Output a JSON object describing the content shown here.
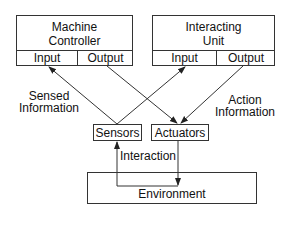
{
  "diagram": {
    "nodes": {
      "machine_controller": {
        "title_line1": "Machine",
        "title_line2": "Controller",
        "port_in": "Input",
        "port_out": "Output"
      },
      "interacting_unit": {
        "title_line1": "Interacting",
        "title_line2": "Unit",
        "port_in": "Input",
        "port_out": "Output"
      },
      "sensors": {
        "label": "Sensors"
      },
      "actuators": {
        "label": "Actuators"
      },
      "environment": {
        "label": "Environment"
      }
    },
    "edge_labels": {
      "sensed_line1": "Sensed",
      "sensed_line2": "Information",
      "action_line1": "Action",
      "action_line2": "Information",
      "interaction": "Interaction"
    },
    "edges": [
      {
        "from": "sensors",
        "to": "machine_controller.input"
      },
      {
        "from": "sensors",
        "to": "interacting_unit.input"
      },
      {
        "from": "machine_controller.output",
        "to": "actuators"
      },
      {
        "from": "interacting_unit.output",
        "to": "actuators"
      },
      {
        "from": "environment",
        "to": "sensors"
      },
      {
        "from": "actuators",
        "to": "environment"
      }
    ],
    "colors": {
      "line": "#333333",
      "background": "#ffffff"
    }
  }
}
